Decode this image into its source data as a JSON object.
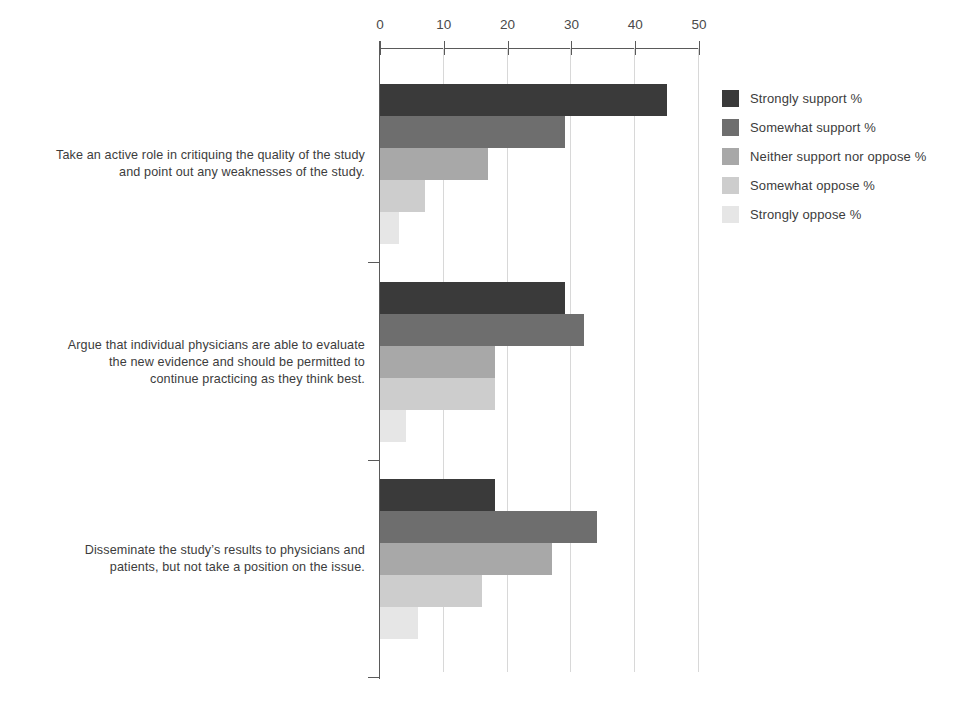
{
  "chart_data": {
    "type": "bar",
    "orientation": "horizontal",
    "grouped": true,
    "title": "",
    "subtitle": "",
    "xlabel": "",
    "ylabel": "",
    "xlim": [
      0,
      50
    ],
    "x_ticks": [
      0,
      10,
      20,
      30,
      40,
      50
    ],
    "x_tick_labels": [
      "0",
      "10",
      "20",
      "30",
      "40",
      "50"
    ],
    "grid": true,
    "grid_axis": "x",
    "legend_position": "right",
    "categories": [
      "Take an active role in critiquing the quality of the study\nand point out any weaknesses of the study.",
      "Argue that individual physicians are able to evaluate\nthe new evidence and should be permitted to\ncontinue practicing as they think best.",
      "Disseminate the study’s results to physicians and\npatients, but not take a position on the issue."
    ],
    "series": [
      {
        "name": "Strongly support %",
        "color": "#3a3a3a",
        "values": [
          45,
          29,
          18
        ]
      },
      {
        "name": "Somewhat support %",
        "color": "#6e6e6e",
        "values": [
          29,
          32,
          34
        ]
      },
      {
        "name": "Neither support nor oppose %",
        "color": "#a8a8a8",
        "values": [
          17,
          18,
          27
        ]
      },
      {
        "name": "Somewhat oppose %",
        "color": "#cdcdcd",
        "values": [
          7,
          18,
          16
        ]
      },
      {
        "name": "Strongly oppose %",
        "color": "#e6e6e6",
        "values": [
          3,
          4,
          6
        ]
      }
    ]
  },
  "legend": {
    "entries": [
      {
        "label": "Strongly support %"
      },
      {
        "label": "Somewhat support %"
      },
      {
        "label": "Neither support nor oppose %"
      },
      {
        "label": "Somewhat oppose %"
      },
      {
        "label": "Strongly oppose %"
      }
    ]
  },
  "axis": {
    "tick_labels": [
      "0",
      "10",
      "20",
      "30",
      "40",
      "50"
    ]
  },
  "colors": {
    "axis": "#5a5a5a",
    "gridline": "#d8d8d8",
    "text": "#3c3c3c",
    "background": "#ffffff"
  }
}
